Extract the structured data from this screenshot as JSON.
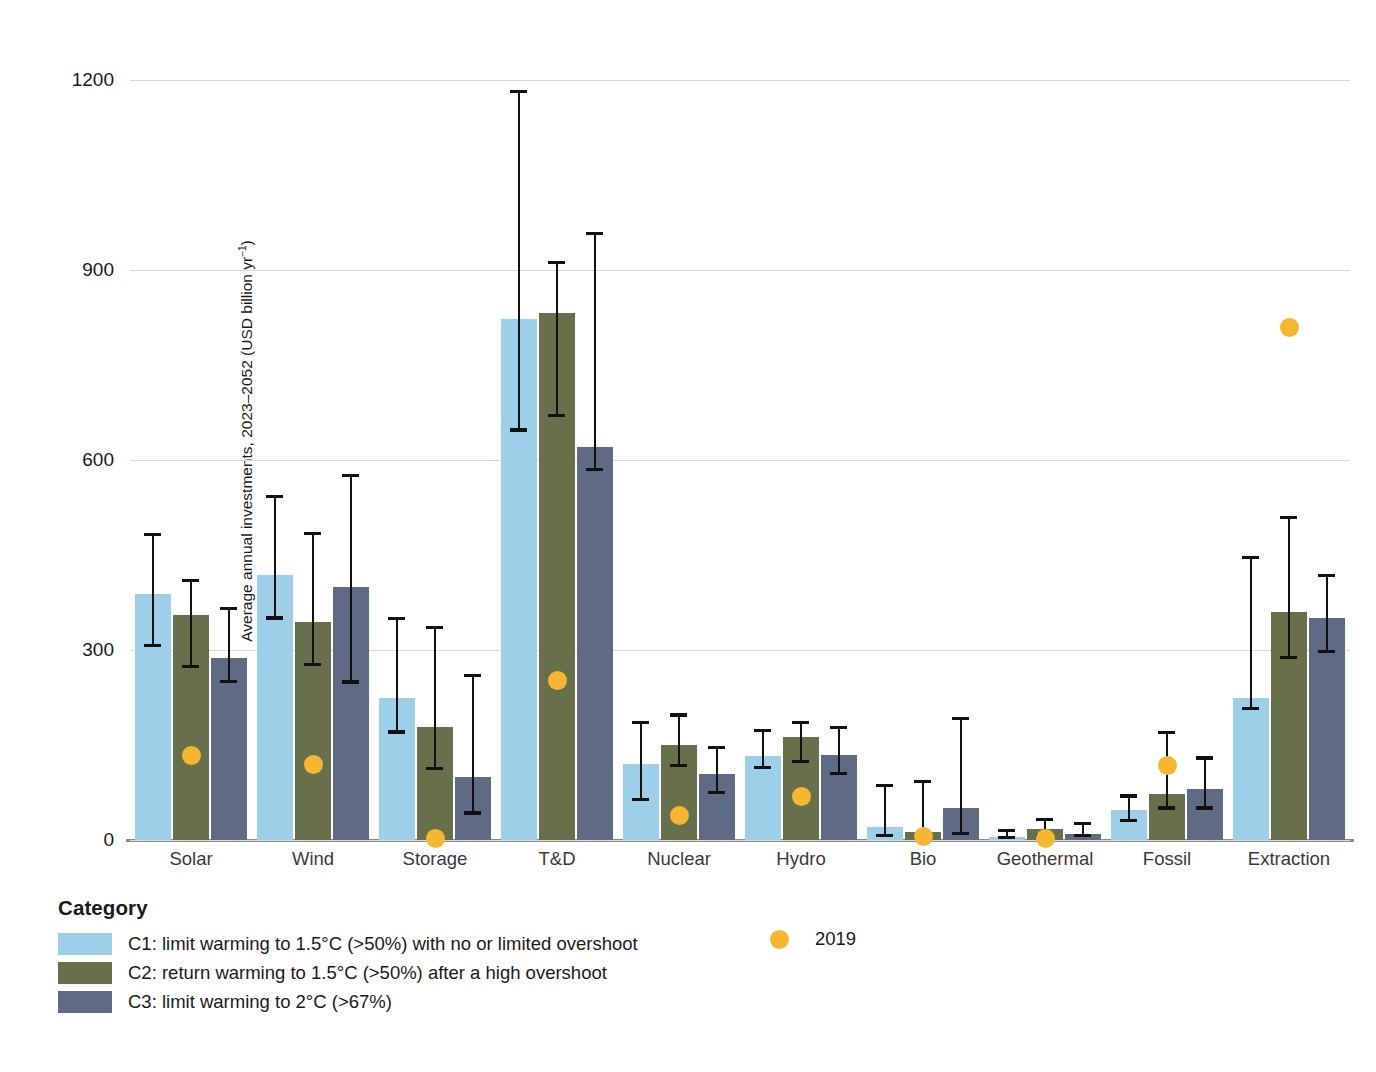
{
  "chart_data": {
    "type": "bar",
    "title": "",
    "xlabel": "",
    "ylabel": "Average annual investments, 2023–2052 (USD billion yr",
    "ylabel_sup": "−1",
    "ylabel_suffix": ")",
    "ylim": [
      0,
      1260
    ],
    "yticks": [
      0,
      300,
      600,
      900,
      1200
    ],
    "ytick_labels": [
      "0",
      "300",
      "600",
      "900",
      "1200"
    ],
    "grid": true,
    "legend_position": "below-left",
    "categories": [
      "Solar",
      "Wind",
      "Storage",
      "T&D",
      "Nuclear",
      "Hydro",
      "Bio",
      "Geothermal",
      "Fossil",
      "Extraction"
    ],
    "series": [
      {
        "name": "C1: limit warming to 1.5°C (>50%) with no or limited overshoot",
        "color": "#9ecfe9",
        "values": [
          388,
          418,
          225,
          822,
          120,
          133,
          20,
          5,
          48,
          225
        ],
        "err_low": [
          305,
          348,
          168,
          645,
          62,
          112,
          5,
          2,
          28,
          205
        ],
        "err_high": [
          485,
          545,
          352,
          1185,
          188,
          175,
          88,
          18,
          72,
          448
        ]
      },
      {
        "name": "C2: return warming to 1.5°C (>50%) after a high overshoot",
        "color": "#67704a",
        "values": [
          355,
          345,
          178,
          832,
          150,
          163,
          12,
          18,
          72,
          360
        ],
        "err_low": [
          272,
          275,
          110,
          668,
          115,
          122,
          2,
          5,
          48,
          285
        ],
        "err_high": [
          412,
          487,
          338,
          915,
          200,
          188,
          95,
          35,
          172,
          512
        ]
      },
      {
        "name": "C3: limit warming to 2°C (>67%)",
        "color": "#5f6b85",
        "values": [
          288,
          400,
          100,
          620,
          105,
          135,
          50,
          10,
          80,
          350
        ],
        "err_low": [
          248,
          247,
          40,
          582,
          72,
          102,
          8,
          5,
          48,
          295
        ],
        "err_high": [
          368,
          578,
          262,
          960,
          148,
          180,
          195,
          28,
          132,
          420
        ]
      }
    ],
    "reference_points": {
      "name": "2019",
      "color": "#f5b731",
      "marker": "circle",
      "values": [
        133,
        120,
        3,
        252,
        38,
        68,
        5,
        2,
        118,
        810
      ]
    }
  },
  "legend": {
    "title": "Category",
    "items": [
      {
        "label": "C1: limit warming to 1.5°C (>50%) with no or limited overshoot",
        "color": "#9ecfe9"
      },
      {
        "label": "C2: return warming to 1.5°C (>50%) after a high overshoot",
        "color": "#67704a"
      },
      {
        "label": "C3: limit warming to 2°C (>67%)",
        "color": "#5f6b85"
      }
    ],
    "point_label": "2019",
    "point_color": "#f5b731"
  }
}
